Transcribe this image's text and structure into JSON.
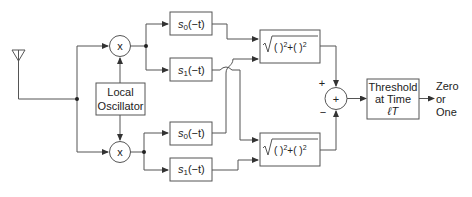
{
  "blocks": {
    "antenna": {
      "icon": "antenna-icon"
    },
    "mixer_top": {
      "label": "x"
    },
    "mixer_bottom": {
      "label": "x"
    },
    "local_oscillator": {
      "line1": "Local",
      "line2": "Oscillator"
    },
    "filter_top_0": {
      "base": "s",
      "sub": "0",
      "arg": "(−t)"
    },
    "filter_top_1": {
      "base": "s",
      "sub": "1",
      "arg": "(−t)"
    },
    "filter_bottom_0": {
      "base": "s",
      "sub": "0",
      "arg": "(−t)"
    },
    "filter_bottom_1": {
      "base": "s",
      "sub": "1",
      "arg": "(−t)"
    },
    "envelope_top": {
      "expr_a": "( )",
      "sup_a": "2",
      "plus": "+",
      "expr_b": "( )",
      "sup_b": "2"
    },
    "envelope_bottom": {
      "expr_a": "( )",
      "sup_a": "2",
      "plus": "+",
      "expr_b": "( )",
      "sup_b": "2"
    },
    "summer": {
      "label": "+",
      "sign_top": "+",
      "sign_bottom": "−"
    },
    "threshold": {
      "line1": "Threshold",
      "line2": "at Time",
      "line3": "ℓT"
    },
    "output": {
      "line1": "Zero",
      "line2": "or",
      "line3": "One"
    }
  },
  "colors": {
    "stroke": "#555555",
    "text": "#222222",
    "background": "#ffffff"
  }
}
